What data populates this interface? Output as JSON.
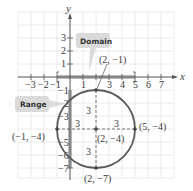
{
  "diagram": {
    "type": "circle-on-coordinate-grid",
    "axes": {
      "x_label": "x",
      "y_label": "y",
      "x_ticks": [
        "−3",
        "−2",
        "−1",
        "1",
        "3",
        "4",
        "5",
        "6",
        "7"
      ],
      "y_ticks": [
        "3",
        "2",
        "1",
        "−1",
        "−2",
        "−3",
        "−5",
        "−6",
        "−7"
      ],
      "x_range": [
        -4,
        8
      ],
      "y_range": [
        -8,
        4
      ]
    },
    "circle": {
      "center": [
        2,
        -4
      ],
      "radius": 3
    },
    "points": [
      {
        "label": "(2, −1)",
        "x": 2,
        "y": -1
      },
      {
        "label": "(5, −4)",
        "x": 5,
        "y": -4
      },
      {
        "label": "(−1, −4)",
        "x": -1,
        "y": -4
      },
      {
        "label": "(2, −4)",
        "x": 2,
        "y": -4
      },
      {
        "label": "(2, −7)",
        "x": 2,
        "y": -7
      }
    ],
    "radius_labels": [
      "3",
      "3",
      "3",
      "3"
    ],
    "callouts": {
      "domain": "Domain",
      "range": "Range"
    },
    "colors": {
      "grid": "#e2e2e2",
      "axis": "#555555",
      "circle": "#5a5a5a",
      "highlight": "#b5b5b5",
      "callout_bg": "#dcdcdc"
    }
  }
}
